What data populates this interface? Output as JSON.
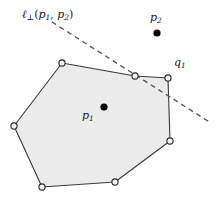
{
  "figure": {
    "background_color": "#ffffff",
    "width": 217,
    "height": 202
  },
  "colors": {
    "polygon_fill": "#ebebeb",
    "polygon_stroke": "#3a3a3a",
    "vertex_fill": "#f2f2f2",
    "vertex_stroke": "#2b2b2b",
    "dashed_line": "#5a5a5a",
    "point_fill": "#000000",
    "label_text": "#1a1a1a"
  },
  "labels": {
    "bisector": {
      "text": "ℓ⊥(p1, p2)",
      "ell": "ℓ",
      "perp": "⊥",
      "open_paren": "(",
      "arg1_base": "p",
      "arg1_sub": "1",
      "comma": ", ",
      "arg2_base": "p",
      "arg2_sub": "2",
      "close_paren": ")",
      "x": 22,
      "y": 9
    },
    "p1": {
      "text": "p1",
      "base": "p",
      "sub": "1",
      "x": 82,
      "y": 110
    },
    "p2": {
      "text": "p2",
      "base": "p",
      "sub": "2",
      "x": 150,
      "y": 12
    },
    "q1": {
      "text": "q1",
      "base": "q",
      "sub": "1",
      "x": 174,
      "y": 57
    }
  },
  "polygon": {
    "name": "convex-polygon",
    "fill": "#ebebeb",
    "stroke": "#3a3a3a",
    "stroke_width": 1.1,
    "points": "62,63 135,76 168,78 170,141 115,182 42,187 14,126",
    "vertices": [
      {
        "name": "vertex-top-left",
        "x": 62,
        "y": 63
      },
      {
        "name": "vertex-top-mid",
        "x": 135,
        "y": 76
      },
      {
        "name": "vertex-q1",
        "x": 168,
        "y": 78
      },
      {
        "name": "vertex-right",
        "x": 170,
        "y": 141
      },
      {
        "name": "vertex-bottom-right",
        "x": 115,
        "y": 182
      },
      {
        "name": "vertex-bottom-left",
        "x": 42,
        "y": 187
      },
      {
        "name": "vertex-left",
        "x": 14,
        "y": 126
      }
    ],
    "vertex_radius": 3.1
  },
  "dashed_line": {
    "name": "perpendicular-bisector-line",
    "x1": 52,
    "y1": 22,
    "x2": 211,
    "y2": 123,
    "stroke": "#5a5a5a",
    "stroke_width": 1.4,
    "dash_pattern": "5,4"
  },
  "points": [
    {
      "name": "point-p1",
      "x": 104,
      "y": 107,
      "r": 3.6,
      "fill": "#000000",
      "label": "p1"
    },
    {
      "name": "point-p2",
      "x": 157,
      "y": 33,
      "r": 3.6,
      "fill": "#000000",
      "label": "p2"
    }
  ]
}
